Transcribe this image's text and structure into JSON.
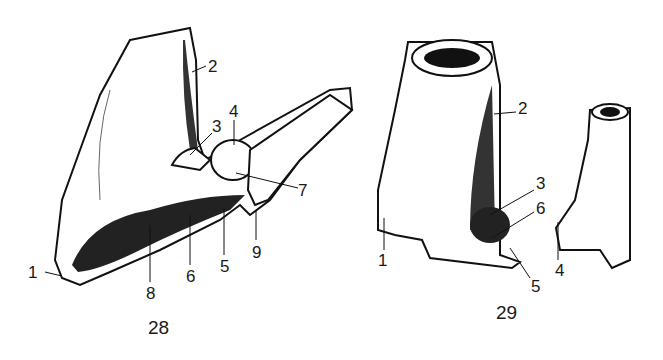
{
  "figures": [
    {
      "caption": "28",
      "labels": [
        {
          "text": "1",
          "x": 33,
          "y": 265
        },
        {
          "text": "2",
          "x": 208,
          "y": 58
        },
        {
          "text": "3",
          "x": 212,
          "y": 118
        },
        {
          "text": "4",
          "x": 229,
          "y": 104
        },
        {
          "text": "5",
          "x": 220,
          "y": 258
        },
        {
          "text": "6",
          "x": 186,
          "y": 268
        },
        {
          "text": "7",
          "x": 298,
          "y": 182
        },
        {
          "text": "8",
          "x": 146,
          "y": 285
        },
        {
          "text": "9",
          "x": 252,
          "y": 244
        }
      ]
    },
    {
      "caption": "29",
      "labels": [
        {
          "text": "1",
          "x": 378,
          "y": 252
        },
        {
          "text": "2",
          "x": 518,
          "y": 100
        },
        {
          "text": "3",
          "x": 536,
          "y": 175
        },
        {
          "text": "4",
          "x": 555,
          "y": 262
        },
        {
          "text": "5",
          "x": 531,
          "y": 278
        },
        {
          "text": "6",
          "x": 536,
          "y": 200
        }
      ]
    }
  ]
}
